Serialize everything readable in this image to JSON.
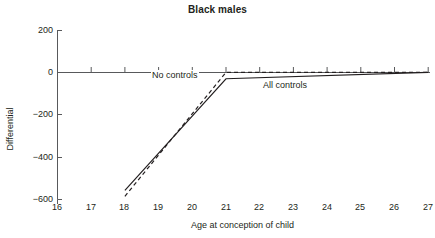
{
  "chart_data": {
    "type": "line",
    "title": "Black males",
    "xlabel": "Age at conception of child",
    "ylabel": "Differential",
    "xlim": [
      16,
      27
    ],
    "ylim": [
      -600,
      200
    ],
    "xticks": [
      16,
      17,
      18,
      19,
      20,
      21,
      22,
      23,
      24,
      25,
      26,
      27
    ],
    "xticklabels": [
      "16",
      "17",
      "18",
      "19",
      "20",
      "21",
      "22",
      "23",
      "24",
      "25",
      "26",
      "27"
    ],
    "yticks": [
      200,
      0,
      -200,
      -400,
      -600
    ],
    "yticklabels": [
      "200",
      "0",
      "−200",
      "−400",
      "−600"
    ],
    "grid": false,
    "legend": "inline-annotations",
    "series": [
      {
        "name": "No controls",
        "style": "dashed",
        "color": "#231f20",
        "x": [
          18,
          21,
          27
        ],
        "y": [
          -585,
          0,
          0
        ]
      },
      {
        "name": "All controls",
        "style": "solid",
        "color": "#231f20",
        "x": [
          18,
          21,
          27
        ],
        "y": [
          -557,
          -30,
          0
        ]
      }
    ],
    "annotations": [
      {
        "text": "No controls",
        "x": 19.7,
        "y": -42
      },
      {
        "text": "All controls",
        "x": 23.1,
        "y": -105
      }
    ]
  },
  "axes": {
    "zero_line_label": "zero-reference-line",
    "axis_color": "#58595b"
  }
}
